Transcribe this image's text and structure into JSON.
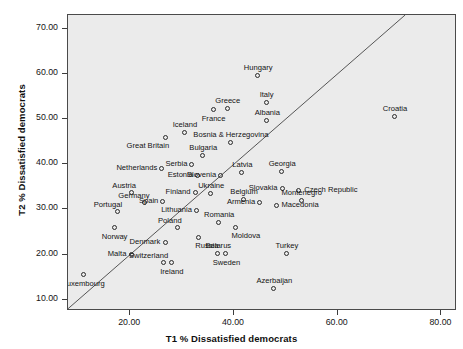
{
  "chart_data": {
    "type": "scatter",
    "title": "",
    "xlabel": "T1 % Dissatisfied democrats",
    "ylabel": "T2 % Dissatisfied democrats",
    "xlim": [
      8.0,
      83.0
    ],
    "ylim": [
      7.5,
      73.0
    ],
    "xticks": [
      "20.00",
      "40.00",
      "60.00",
      "80.00"
    ],
    "xtick_values": [
      20,
      40,
      60,
      80
    ],
    "yticks": [
      "10.00",
      "20.00",
      "30.00",
      "40.00",
      "50.00",
      "60.00",
      "70.00"
    ],
    "ytick_values": [
      10,
      20,
      30,
      40,
      50,
      60,
      70
    ],
    "grid": false,
    "legend": "none",
    "reference_line": {
      "kind": "diagonal-identity",
      "description": "45-degree y = x reference line",
      "color": "#555555"
    },
    "plot_background": "#ebebeb",
    "marker": "open-circle",
    "points": [
      {
        "label": "Luxembourg",
        "x": 11.0,
        "y": 15.5,
        "label_pos": "below"
      },
      {
        "label": "Malta",
        "x": 20.3,
        "y": 20.0,
        "label_pos": "left"
      },
      {
        "label": "Norway",
        "x": 17.0,
        "y": 25.8,
        "label_pos": "below"
      },
      {
        "label": "Portugal",
        "x": 17.6,
        "y": 29.5,
        "label_pos": "above-left"
      },
      {
        "label": "Austria",
        "x": 20.4,
        "y": 33.6,
        "label_pos": "above-left"
      },
      {
        "label": "Germany",
        "x": 22.9,
        "y": 31.4,
        "label_pos": "above-left"
      },
      {
        "label": "Great Britain",
        "x": 26.8,
        "y": 45.8,
        "label_pos": "below-left"
      },
      {
        "label": "Iceland",
        "x": 30.6,
        "y": 46.8,
        "label_pos": "above"
      },
      {
        "label": "Netherlands",
        "x": 26.2,
        "y": 38.9,
        "label_pos": "left"
      },
      {
        "label": "Spain",
        "x": 26.3,
        "y": 31.6,
        "label_pos": "left"
      },
      {
        "label": "Switzerland",
        "x": 26.5,
        "y": 18.2,
        "label_pos": "above-left"
      },
      {
        "label": "Denmark",
        "x": 26.8,
        "y": 22.6,
        "label_pos": "left"
      },
      {
        "label": "Ireland",
        "x": 28.0,
        "y": 18.2,
        "label_pos": "below"
      },
      {
        "label": "Poland",
        "x": 29.2,
        "y": 25.8,
        "label_pos": "above-left"
      },
      {
        "label": "Serbia",
        "x": 32.0,
        "y": 39.9,
        "label_pos": "left"
      },
      {
        "label": "Bulgaria",
        "x": 34.1,
        "y": 41.7,
        "label_pos": "above"
      },
      {
        "label": "Estonia",
        "x": 33.0,
        "y": 37.4,
        "label_pos": "left"
      },
      {
        "label": "Finland",
        "x": 32.6,
        "y": 33.6,
        "label_pos": "left"
      },
      {
        "label": "Lithuania",
        "x": 32.9,
        "y": 29.7,
        "label_pos": "left"
      },
      {
        "label": "Russia",
        "x": 33.3,
        "y": 23.6,
        "label_pos": "below-right"
      },
      {
        "label": "Ukraine",
        "x": 35.6,
        "y": 33.4,
        "label_pos": "above"
      },
      {
        "label": "Slovenia",
        "x": 37.5,
        "y": 37.4,
        "label_pos": "left"
      },
      {
        "label": "Greece",
        "x": 38.8,
        "y": 52.1,
        "label_pos": "above"
      },
      {
        "label": "France",
        "x": 36.1,
        "y": 52.0,
        "label_pos": "below"
      },
      {
        "label": "Romania",
        "x": 37.1,
        "y": 27.0,
        "label_pos": "above"
      },
      {
        "label": "Sweden",
        "x": 38.5,
        "y": 20.1,
        "label_pos": "below"
      },
      {
        "label": "Belarus",
        "x": 37.0,
        "y": 20.2,
        "label_pos": "above"
      },
      {
        "label": "Bosnia & Herzegovina",
        "x": 39.4,
        "y": 44.6,
        "label_pos": "above"
      },
      {
        "label": "Latvia",
        "x": 41.6,
        "y": 38.1,
        "label_pos": "above"
      },
      {
        "label": "Moldova",
        "x": 40.3,
        "y": 25.9,
        "label_pos": "below-right"
      },
      {
        "label": "Belgium",
        "x": 41.9,
        "y": 32.0,
        "label_pos": "above"
      },
      {
        "label": "Hungary",
        "x": 44.7,
        "y": 59.6,
        "label_pos": "above"
      },
      {
        "label": "Italy",
        "x": 46.3,
        "y": 53.5,
        "label_pos": "above"
      },
      {
        "label": "Albania",
        "x": 46.4,
        "y": 49.5,
        "label_pos": "above"
      },
      {
        "label": "Armenia",
        "x": 45.0,
        "y": 31.5,
        "label_pos": "left"
      },
      {
        "label": "Azerbaijan",
        "x": 47.8,
        "y": 12.3,
        "label_pos": "above"
      },
      {
        "label": "Georgia",
        "x": 49.3,
        "y": 38.3,
        "label_pos": "above"
      },
      {
        "label": "Slovakia",
        "x": 49.4,
        "y": 34.4,
        "label_pos": "left"
      },
      {
        "label": "Macedonia",
        "x": 48.2,
        "y": 30.8,
        "label_pos": "right"
      },
      {
        "label": "Turkey",
        "x": 50.2,
        "y": 20.2,
        "label_pos": "above"
      },
      {
        "label": "Czech Republic",
        "x": 52.6,
        "y": 34.0,
        "label_pos": "right"
      },
      {
        "label": "Montenegro",
        "x": 53.1,
        "y": 31.8,
        "label_pos": "above"
      },
      {
        "label": "Croatia",
        "x": 71.0,
        "y": 50.4,
        "label_pos": "above"
      }
    ]
  }
}
